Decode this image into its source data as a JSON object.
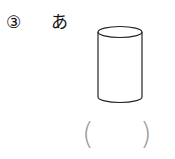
{
  "problem": {
    "number": "③",
    "item_label": "あ",
    "shape": "cylinder",
    "answer_open": "(",
    "answer_close": ")",
    "answer_value": ""
  },
  "colors": {
    "text": "#111111",
    "outline": "#222222",
    "paren": "#9a9a9a"
  }
}
